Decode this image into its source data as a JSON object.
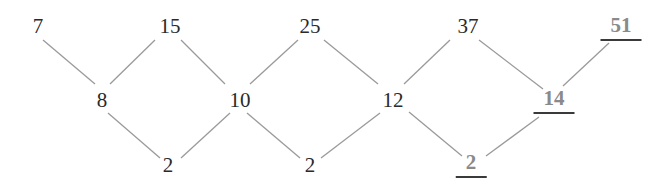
{
  "diagram": {
    "title": "",
    "type": "difference-table",
    "colors": {
      "text": "#2a2a2a",
      "highlight_text": "#8a8a8a",
      "underline": "#3a3a3a",
      "edge": "#9a9a9a"
    },
    "rows": {
      "sequence": [
        "7",
        "15",
        "25",
        "37",
        "51"
      ],
      "first_differences": [
        "8",
        "10",
        "12",
        "14"
      ],
      "second_differences": [
        "2",
        "2",
        "2"
      ]
    },
    "nodes": [
      {
        "id": "s0",
        "label": "7",
        "x": 38,
        "y": 26,
        "highlight": false
      },
      {
        "id": "s1",
        "label": "15",
        "x": 170,
        "y": 26,
        "highlight": false
      },
      {
        "id": "s2",
        "label": "25",
        "x": 310,
        "y": 26,
        "highlight": false
      },
      {
        "id": "s3",
        "label": "37",
        "x": 468,
        "y": 26,
        "highlight": false
      },
      {
        "id": "s4",
        "label": "51",
        "x": 621,
        "y": 28,
        "highlight": true
      },
      {
        "id": "d0",
        "label": "8",
        "x": 102,
        "y": 100,
        "highlight": false
      },
      {
        "id": "d1",
        "label": "10",
        "x": 240,
        "y": 100,
        "highlight": false
      },
      {
        "id": "d2",
        "label": "12",
        "x": 393,
        "y": 100,
        "highlight": false
      },
      {
        "id": "d3",
        "label": "14",
        "x": 554,
        "y": 101,
        "highlight": true
      },
      {
        "id": "e0",
        "label": "2",
        "x": 168,
        "y": 165,
        "highlight": false
      },
      {
        "id": "e1",
        "label": "2",
        "x": 310,
        "y": 165,
        "highlight": false
      },
      {
        "id": "e2",
        "label": "2",
        "x": 471,
        "y": 165,
        "highlight": true
      }
    ],
    "edges": [
      {
        "from": [
          43,
          40
        ],
        "to": [
          95,
          84
        ]
      },
      {
        "from": [
          155,
          40
        ],
        "to": [
          110,
          84
        ]
      },
      {
        "from": [
          181,
          40
        ],
        "to": [
          225,
          84
        ]
      },
      {
        "from": [
          298,
          40
        ],
        "to": [
          250,
          84
        ]
      },
      {
        "from": [
          324,
          40
        ],
        "to": [
          378,
          84
        ]
      },
      {
        "from": [
          450,
          40
        ],
        "to": [
          404,
          84
        ]
      },
      {
        "from": [
          479,
          40
        ],
        "to": [
          543,
          89
        ]
      },
      {
        "from": [
          609,
          43
        ],
        "to": [
          563,
          86
        ]
      },
      {
        "from": [
          108,
          113
        ],
        "to": [
          160,
          158
        ]
      },
      {
        "from": [
          230,
          113
        ],
        "to": [
          181,
          158
        ]
      },
      {
        "from": [
          247,
          113
        ],
        "to": [
          300,
          158
        ]
      },
      {
        "from": [
          380,
          113
        ],
        "to": [
          321,
          158
        ]
      },
      {
        "from": [
          409,
          112
        ],
        "to": [
          462,
          156
        ]
      },
      {
        "from": [
          539,
          117
        ],
        "to": [
          486,
          156
        ]
      }
    ]
  }
}
